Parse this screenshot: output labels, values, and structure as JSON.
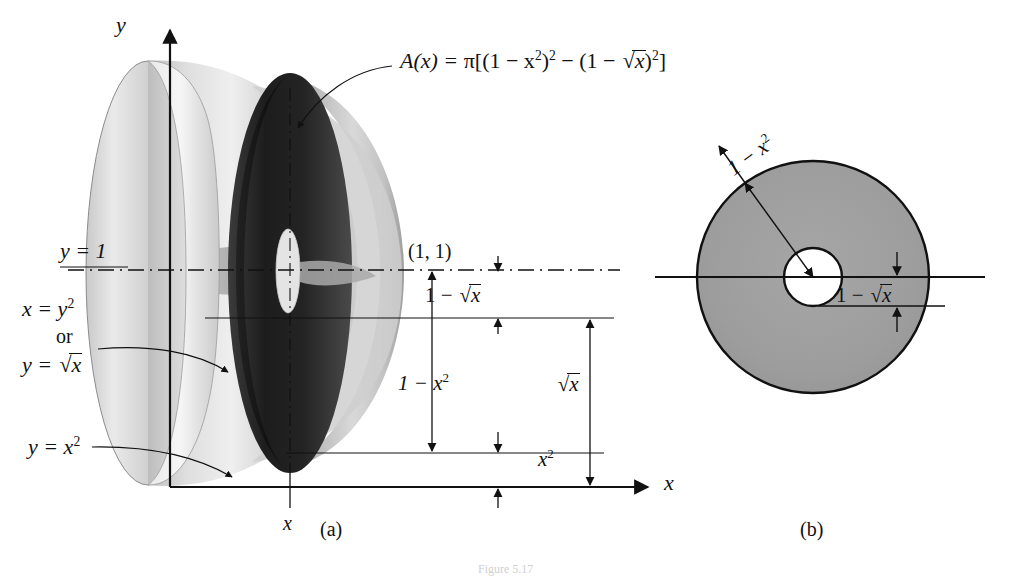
{
  "figure": {
    "title_text": "Figure 5.17",
    "panels": [
      {
        "key": "a",
        "caption": "(a)",
        "description": "solid of revolution with washer cross-section"
      },
      {
        "key": "b",
        "caption": "(b)",
        "description": "washer (annulus) cross-section face-on"
      }
    ]
  },
  "panel_a": {
    "axis_x_label": "x",
    "axis_y_label": "y",
    "tick_x_label": "x",
    "point_label": "(1, 1)",
    "curve_label_top": "y = 1",
    "curve_label_mid_1": "x = y",
    "curve_label_mid_1_exp": "2",
    "curve_label_mid_or": "or",
    "curve_label_mid_2": "y = ",
    "curve_label_mid_2_rad": "x",
    "curve_label_bottom": "y = x",
    "curve_label_bottom_exp": "2",
    "area_formula": {
      "lhs": "A(x) = ",
      "pi": "π",
      "open": "[(1 − x",
      "exp1": "2",
      "mid": ")",
      "exp2": "2",
      "minus": " − (1 − ",
      "radicand": "x",
      "close": ")",
      "exp3": "2",
      "bracket": "]"
    },
    "measures": [
      {
        "name": "one-minus-sqrt-x",
        "text_a": "1 − ",
        "text_b": "x"
      },
      {
        "name": "one-minus-x-squared",
        "text_a": "1 − x",
        "text_b": "2"
      },
      {
        "name": "x-squared",
        "text_a": "x",
        "text_b": "2"
      },
      {
        "name": "sqrt-x",
        "text_a": "",
        "text_b": "x"
      }
    ]
  },
  "panel_b": {
    "outer_radius_label_a": "1 − x",
    "outer_radius_label_b": "2",
    "inner_gap_label_a": "1 − ",
    "inner_gap_label_b": "x",
    "colors": {
      "washer_fill": "#9d9d9d",
      "hole_fill": "#ffffff",
      "stroke": "#111111"
    }
  },
  "colors": {
    "background": "#ffffff",
    "ink": "#111111",
    "solid_light": "#d8d8d8",
    "solid_mid": "#b6b6b6",
    "solid_dark": "#2a2a2a",
    "washer_gray": "#9d9d9d"
  }
}
